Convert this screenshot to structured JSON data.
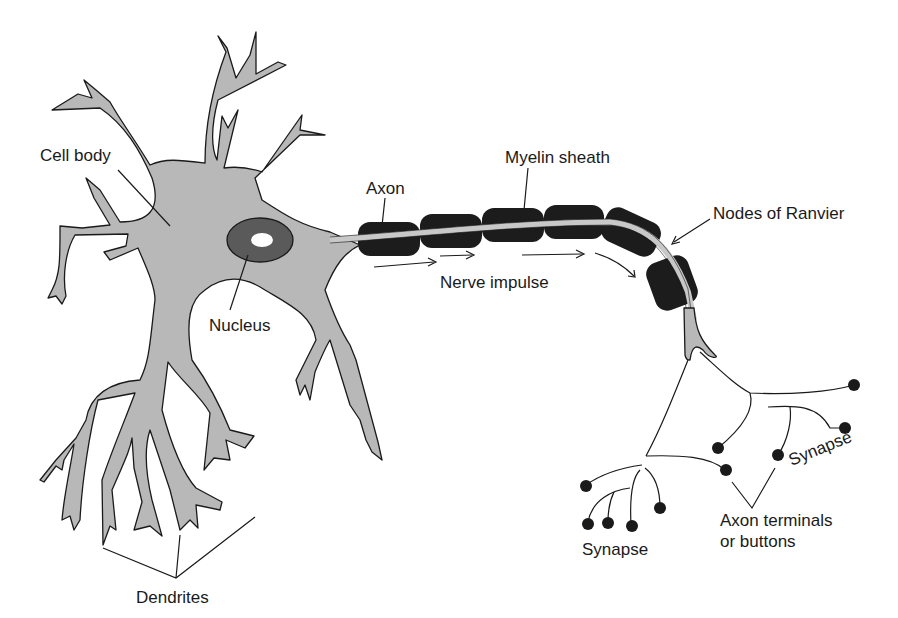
{
  "diagram": {
    "colors": {
      "cell_fill": "#b8b8b8",
      "outline": "#1a1a1a",
      "myelin": "#1c1c1c",
      "nucleus": "#5a5a5a",
      "background": "#ffffff"
    },
    "labels": {
      "cell_body": "Cell body",
      "axon": "Axon",
      "myelin_sheath": "Myelin sheath",
      "nodes_of_ranvier": "Nodes of Ranvier",
      "nerve_impulse": "Nerve impulse",
      "nucleus": "Nucleus",
      "synapse_right": "Synapse",
      "synapse_bottom": "Synapse",
      "axon_terminals_line1": "Axon terminals",
      "axon_terminals_line2": "or buttons",
      "dendrites": "Dendrites"
    }
  }
}
